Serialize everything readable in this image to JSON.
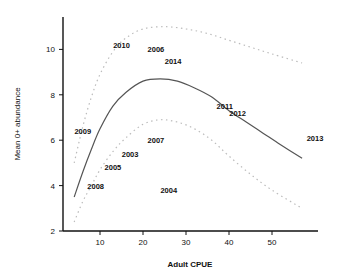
{
  "chart_data": {
    "type": "scatter",
    "title": "",
    "xlabel": "Adult CPUE",
    "ylabel": "Mean 0+ abundance",
    "xlim": [
      0,
      60
    ],
    "ylim": [
      2,
      11.5
    ],
    "xticks": [
      10,
      20,
      30,
      40,
      50
    ],
    "yticks": [
      2,
      4,
      6,
      8,
      10
    ],
    "grid": false,
    "legend": null,
    "points": [
      {
        "label": "2003",
        "x": 17,
        "y": 5.4
      },
      {
        "label": "2004",
        "x": 26,
        "y": 3.8
      },
      {
        "label": "2005",
        "x": 13,
        "y": 4.8
      },
      {
        "label": "2006",
        "x": 23,
        "y": 10.0
      },
      {
        "label": "2007",
        "x": 23,
        "y": 6.0
      },
      {
        "label": "2008",
        "x": 9,
        "y": 4.0
      },
      {
        "label": "2009",
        "x": 6,
        "y": 6.4
      },
      {
        "label": "2010",
        "x": 15,
        "y": 10.2
      },
      {
        "label": "2011",
        "x": 39,
        "y": 7.5
      },
      {
        "label": "2012",
        "x": 42,
        "y": 7.2
      },
      {
        "label": "2013",
        "x": 60,
        "y": 6.1
      },
      {
        "label": "2014",
        "x": 27,
        "y": 9.5
      }
    ],
    "series": [
      {
        "name": "fitted",
        "style": "solid",
        "x": [
          4,
          6,
          8,
          10,
          13,
          16,
          20,
          24,
          28,
          32,
          36,
          40,
          44,
          48,
          52,
          57
        ],
        "y": [
          3.5,
          4.6,
          5.6,
          6.5,
          7.5,
          8.1,
          8.6,
          8.7,
          8.6,
          8.3,
          7.9,
          7.3,
          6.8,
          6.3,
          5.8,
          5.2
        ]
      },
      {
        "name": "upper_ci",
        "style": "dashed",
        "x": [
          4,
          6,
          8,
          10,
          13,
          16,
          20,
          25,
          30,
          35,
          40,
          45,
          50,
          57
        ],
        "y": [
          5.0,
          6.6,
          7.9,
          8.9,
          9.9,
          10.5,
          10.9,
          11.0,
          10.9,
          10.7,
          10.4,
          10.1,
          9.8,
          9.4
        ]
      },
      {
        "name": "lower_ci",
        "style": "dashed",
        "x": [
          4,
          6,
          8,
          10,
          13,
          16,
          20,
          24,
          28,
          32,
          36,
          40,
          45,
          50,
          57
        ],
        "y": [
          2.4,
          3.3,
          4.0,
          4.7,
          5.5,
          6.1,
          6.7,
          6.9,
          6.8,
          6.5,
          6.0,
          5.3,
          4.5,
          3.8,
          3.0
        ]
      }
    ]
  },
  "style": {
    "axis_color": "#111111",
    "fit_color": "#555555",
    "ci_color": "#bbbbbb"
  }
}
